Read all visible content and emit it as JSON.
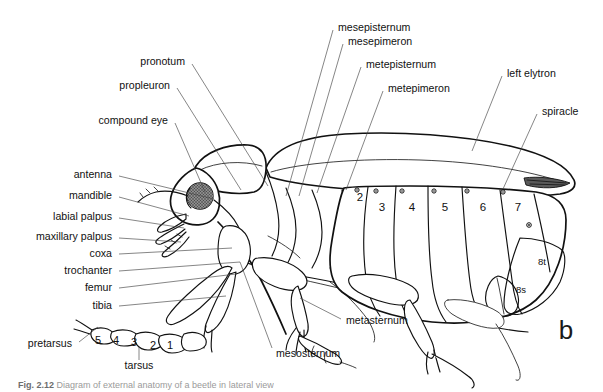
{
  "figure": {
    "panel_label": "b",
    "background_color": "#ffffff",
    "ink_color": "#111111",
    "leader_color": "#444444"
  },
  "labels_left": [
    {
      "id": "pronotum",
      "text": "pronotum",
      "x": 185,
      "y": 62,
      "lx1": 192,
      "ly1": 64,
      "lx2": 268,
      "ly2": 186
    },
    {
      "id": "propleuron",
      "text": "propleuron",
      "x": 170,
      "y": 86,
      "lx1": 177,
      "ly1": 88,
      "lx2": 241,
      "ly2": 190
    },
    {
      "id": "compound-eye",
      "text": "compound eye",
      "x": 168,
      "y": 121,
      "lx1": 175,
      "ly1": 123,
      "lx2": 205,
      "ly2": 192
    },
    {
      "id": "antenna",
      "text": "antenna",
      "x": 112,
      "y": 175,
      "lx1": 119,
      "ly1": 176,
      "lx2": 214,
      "ly2": 199
    },
    {
      "id": "mandible",
      "text": "mandible",
      "x": 112,
      "y": 196,
      "lx1": 119,
      "ly1": 197,
      "lx2": 189,
      "ly2": 216
    },
    {
      "id": "labial-palpus",
      "text": "labial palpus",
      "x": 112,
      "y": 217,
      "lx1": 119,
      "ly1": 218,
      "lx2": 184,
      "ly2": 228
    },
    {
      "id": "maxillary-palpus",
      "text": "maxillary palpus",
      "x": 112,
      "y": 237,
      "lx1": 119,
      "ly1": 238,
      "lx2": 181,
      "ly2": 240
    },
    {
      "id": "coxa",
      "text": "coxa",
      "x": 112,
      "y": 254,
      "lx1": 119,
      "ly1": 254,
      "lx2": 232,
      "ly2": 248
    },
    {
      "id": "trochanter",
      "text": "trochanter",
      "x": 112,
      "y": 271,
      "lx1": 119,
      "ly1": 271,
      "lx2": 240,
      "ly2": 262
    },
    {
      "id": "femur",
      "text": "femur",
      "x": 112,
      "y": 288,
      "lx1": 119,
      "ly1": 288,
      "lx2": 236,
      "ly2": 274
    },
    {
      "id": "tibia",
      "text": "tibia",
      "x": 112,
      "y": 306,
      "lx1": 119,
      "ly1": 306,
      "lx2": 226,
      "ly2": 296
    },
    {
      "id": "pretarsus",
      "text": "pretarsus",
      "x": 72,
      "y": 344,
      "lx1": 79,
      "ly1": 342,
      "lx2": 98,
      "ly2": 326
    },
    {
      "id": "tarsus",
      "text": "tarsus",
      "x": 139,
      "y": 366,
      "lx1": 139,
      "ly1": 360,
      "lx2": 139,
      "ly2": 345
    }
  ],
  "labels_top": [
    {
      "id": "mesepisternum",
      "text": "mesepisternum",
      "x": 338,
      "y": 28,
      "lx1": 333,
      "ly1": 30,
      "lx2": 286,
      "ly2": 196
    },
    {
      "id": "mesepimeron",
      "text": "mesepimeron",
      "x": 348,
      "y": 42,
      "lx1": 343,
      "ly1": 44,
      "lx2": 298,
      "ly2": 196
    },
    {
      "id": "metepisternum",
      "text": "metepisternum",
      "x": 366,
      "y": 65,
      "lx1": 361,
      "ly1": 67,
      "lx2": 316,
      "ly2": 193
    },
    {
      "id": "metepimeron",
      "text": "metepimeron",
      "x": 388,
      "y": 89,
      "lx1": 383,
      "ly1": 91,
      "lx2": 346,
      "ly2": 190
    }
  ],
  "labels_right": [
    {
      "id": "left-elytron",
      "text": "left elytron",
      "x": 507,
      "y": 74,
      "lx1": 502,
      "ly1": 76,
      "lx2": 472,
      "ly2": 151
    },
    {
      "id": "spiracle",
      "text": "spiracle",
      "x": 542,
      "y": 112,
      "lx1": 537,
      "ly1": 114,
      "lx2": 497,
      "ly2": 187
    }
  ],
  "labels_bottom": [
    {
      "id": "metasternum",
      "text": "metasternum",
      "x": 346,
      "y": 321,
      "lx1": 341,
      "ly1": 319,
      "lx2": 300,
      "ly2": 298
    },
    {
      "id": "mesosternum",
      "text": "mesosternum",
      "x": 276,
      "y": 354,
      "lx1": 272,
      "ly1": 348,
      "lx2": 240,
      "ly2": 262
    }
  ],
  "abdominal_segments": [
    {
      "id": "seg-2",
      "text": "2",
      "x": 360,
      "y": 198,
      "size": "large"
    },
    {
      "id": "seg-3",
      "text": "3",
      "x": 382,
      "y": 208,
      "size": "large"
    },
    {
      "id": "seg-4",
      "text": "4",
      "x": 412,
      "y": 208,
      "size": "large"
    },
    {
      "id": "seg-5",
      "text": "5",
      "x": 445,
      "y": 208,
      "size": "large"
    },
    {
      "id": "seg-6",
      "text": "6",
      "x": 483,
      "y": 208,
      "size": "large"
    },
    {
      "id": "seg-7",
      "text": "7",
      "x": 518,
      "y": 208,
      "size": "large"
    },
    {
      "id": "seg-8t",
      "text": "8t",
      "x": 542,
      "y": 262,
      "size": "small"
    },
    {
      "id": "seg-8s",
      "text": "8s",
      "x": 521,
      "y": 290,
      "size": "small"
    }
  ],
  "tarsal_segments": [
    {
      "id": "tars-5",
      "text": "5",
      "x": 98,
      "y": 341
    },
    {
      "id": "tars-4",
      "text": "4",
      "x": 116,
      "y": 341
    },
    {
      "id": "tars-3",
      "text": "3",
      "x": 134,
      "y": 343
    },
    {
      "id": "tars-2",
      "text": "2",
      "x": 153,
      "y": 346
    },
    {
      "id": "tars-1",
      "text": "1",
      "x": 170,
      "y": 346
    }
  ],
  "spiracle_dots": [
    {
      "x": 357,
      "y": 190
    },
    {
      "x": 376,
      "y": 188
    },
    {
      "x": 402,
      "y": 189
    },
    {
      "x": 434,
      "y": 189
    },
    {
      "x": 467,
      "y": 189
    },
    {
      "x": 503,
      "y": 190
    },
    {
      "x": 529,
      "y": 225
    }
  ],
  "caption": {
    "prefix": "Fig. 2.12",
    "text": "Diagram of external anatomy of a beetle in lateral view"
  }
}
